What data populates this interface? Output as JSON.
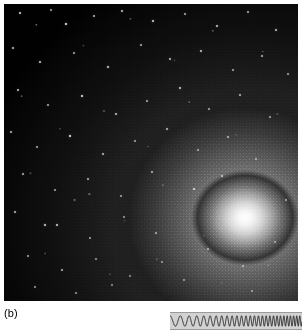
{
  "figure": {
    "panel_label": "(b)",
    "photo": {
      "name": "astronomical-photograph",
      "description": "dwarf elliptical galaxy resolved into stars",
      "background_color": "#000000",
      "core_color": "#ffffff",
      "core_position_percent": {
        "x": 82,
        "y": 72
      },
      "halo_mid_color": "#6a6a6a",
      "halo_outer_color": "#242424"
    },
    "chirp": {
      "name": "chirp-waveform",
      "background_color": "#d2d2d2",
      "stroke_color": "#1a1a1a",
      "border_color": "#9a9a9a",
      "cycles": 18,
      "amplitude": 5.2,
      "start_frequency_px": 11.5,
      "end_frequency_px": 3.0,
      "width": 132,
      "height": 16
    },
    "stars": [
      {
        "x": 16,
        "y": 9,
        "r": 0.8,
        "o": 0.75
      },
      {
        "x": 47,
        "y": 6,
        "r": 0.7,
        "o": 0.6
      },
      {
        "x": 62,
        "y": 20,
        "r": 1.0,
        "o": 0.95
      },
      {
        "x": 90,
        "y": 12,
        "r": 0.7,
        "o": 0.65
      },
      {
        "x": 118,
        "y": 7,
        "r": 0.8,
        "o": 0.7
      },
      {
        "x": 149,
        "y": 17,
        "r": 0.9,
        "o": 0.8
      },
      {
        "x": 181,
        "y": 10,
        "r": 0.7,
        "o": 0.6
      },
      {
        "x": 213,
        "y": 22,
        "r": 0.8,
        "o": 0.7
      },
      {
        "x": 244,
        "y": 8,
        "r": 0.7,
        "o": 0.58
      },
      {
        "x": 272,
        "y": 26,
        "r": 0.9,
        "o": 0.72
      },
      {
        "x": 9,
        "y": 44,
        "r": 0.8,
        "o": 0.68
      },
      {
        "x": 36,
        "y": 58,
        "r": 0.8,
        "o": 0.72
      },
      {
        "x": 70,
        "y": 49,
        "r": 0.7,
        "o": 0.58
      },
      {
        "x": 104,
        "y": 63,
        "r": 0.9,
        "o": 0.78
      },
      {
        "x": 137,
        "y": 41,
        "r": 0.7,
        "o": 0.6
      },
      {
        "x": 166,
        "y": 55,
        "r": 0.8,
        "o": 0.66
      },
      {
        "x": 197,
        "y": 47,
        "r": 0.8,
        "o": 0.7
      },
      {
        "x": 229,
        "y": 66,
        "r": 0.7,
        "o": 0.56
      },
      {
        "x": 258,
        "y": 52,
        "r": 0.8,
        "o": 0.62
      },
      {
        "x": 284,
        "y": 70,
        "r": 0.7,
        "o": 0.55
      },
      {
        "x": 14,
        "y": 86,
        "r": 0.8,
        "o": 0.7
      },
      {
        "x": 44,
        "y": 101,
        "r": 0.7,
        "o": 0.6
      },
      {
        "x": 78,
        "y": 92,
        "r": 1.0,
        "o": 0.9
      },
      {
        "x": 112,
        "y": 110,
        "r": 0.8,
        "o": 0.68
      },
      {
        "x": 143,
        "y": 97,
        "r": 0.7,
        "o": 0.58
      },
      {
        "x": 176,
        "y": 84,
        "r": 0.9,
        "o": 0.76
      },
      {
        "x": 205,
        "y": 105,
        "r": 0.7,
        "o": 0.55
      },
      {
        "x": 236,
        "y": 91,
        "r": 0.8,
        "o": 0.62
      },
      {
        "x": 266,
        "y": 113,
        "r": 0.7,
        "o": 0.52
      },
      {
        "x": 7,
        "y": 128,
        "r": 0.8,
        "o": 0.66
      },
      {
        "x": 33,
        "y": 143,
        "r": 0.7,
        "o": 0.58
      },
      {
        "x": 66,
        "y": 132,
        "r": 1.1,
        "o": 0.92
      },
      {
        "x": 99,
        "y": 150,
        "r": 0.8,
        "o": 0.66
      },
      {
        "x": 131,
        "y": 137,
        "r": 0.7,
        "o": 0.56
      },
      {
        "x": 163,
        "y": 125,
        "r": 0.8,
        "o": 0.64
      },
      {
        "x": 194,
        "y": 146,
        "r": 0.7,
        "o": 0.52
      },
      {
        "x": 224,
        "y": 133,
        "r": 0.8,
        "o": 0.58
      },
      {
        "x": 252,
        "y": 155,
        "r": 0.7,
        "o": 0.5
      },
      {
        "x": 19,
        "y": 170,
        "r": 0.8,
        "o": 0.64
      },
      {
        "x": 51,
        "y": 186,
        "r": 0.7,
        "o": 0.56
      },
      {
        "x": 84,
        "y": 175,
        "r": 0.8,
        "o": 0.62
      },
      {
        "x": 117,
        "y": 192,
        "r": 0.7,
        "o": 0.54
      },
      {
        "x": 148,
        "y": 168,
        "r": 0.8,
        "o": 0.58
      },
      {
        "x": 11,
        "y": 208,
        "r": 0.9,
        "o": 0.7
      },
      {
        "x": 41,
        "y": 221,
        "r": 0.9,
        "o": 0.78
      },
      {
        "x": 53,
        "y": 221,
        "r": 0.9,
        "o": 0.78
      },
      {
        "x": 86,
        "y": 234,
        "r": 0.7,
        "o": 0.54
      },
      {
        "x": 120,
        "y": 213,
        "r": 0.7,
        "o": 0.5
      },
      {
        "x": 152,
        "y": 229,
        "r": 0.8,
        "o": 0.56
      },
      {
        "x": 24,
        "y": 252,
        "r": 0.7,
        "o": 0.56
      },
      {
        "x": 58,
        "y": 266,
        "r": 0.8,
        "o": 0.6
      },
      {
        "x": 92,
        "y": 255,
        "r": 0.7,
        "o": 0.5
      },
      {
        "x": 126,
        "y": 272,
        "r": 0.7,
        "o": 0.48
      },
      {
        "x": 158,
        "y": 258,
        "r": 0.7,
        "o": 0.48
      },
      {
        "x": 31,
        "y": 283,
        "r": 0.7,
        "o": 0.52
      },
      {
        "x": 72,
        "y": 289,
        "r": 0.7,
        "o": 0.5
      },
      {
        "x": 108,
        "y": 281,
        "r": 0.7,
        "o": 0.46
      },
      {
        "x": 190,
        "y": 185,
        "r": 0.8,
        "o": 0.7
      },
      {
        "x": 218,
        "y": 172,
        "r": 0.7,
        "o": 0.6
      },
      {
        "x": 204,
        "y": 245,
        "r": 0.7,
        "o": 0.55
      },
      {
        "x": 239,
        "y": 262,
        "r": 0.7,
        "o": 0.5
      },
      {
        "x": 271,
        "y": 238,
        "r": 0.7,
        "o": 0.48
      },
      {
        "x": 180,
        "y": 276,
        "r": 0.7,
        "o": 0.5
      },
      {
        "x": 248,
        "y": 287,
        "r": 0.7,
        "o": 0.46
      },
      {
        "x": 282,
        "y": 196,
        "r": 0.7,
        "o": 0.52
      }
    ]
  }
}
